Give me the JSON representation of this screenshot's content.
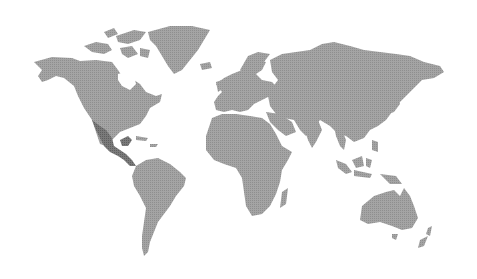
{
  "map": {
    "title": "World map",
    "projection": "equirectangular-like",
    "background_color": "#ffffff",
    "land_color": "#9a9a9a",
    "highlight_color": "#6e6e6e",
    "highlighted_regions": [
      "Mexico",
      "Central America"
    ],
    "continents": [
      "North America",
      "Greenland",
      "South America",
      "Europe",
      "Africa",
      "Asia",
      "Oceania"
    ]
  }
}
